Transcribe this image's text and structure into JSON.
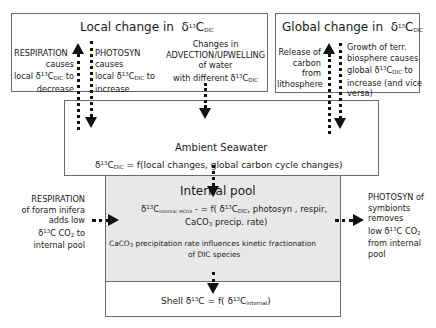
{
  "local_box": {
    "title": "Local change in",
    "title_sym": "δ",
    "title_sup": "13",
    "title_c": "C",
    "title_sub": "DIC",
    "respiration": {
      "line1": "RESPIRATION",
      "line2": "causes",
      "line3_pre": "local δ",
      "line3_sup": "13",
      "line3_c": "C",
      "line3_sub": "DIC",
      "line3_post": " to",
      "line4": "decrease"
    },
    "photosyn": {
      "line1": "PHOTOSYN",
      "line2": "causes",
      "line3_pre": "local δ",
      "line3_sup": "13",
      "line3_c": "C",
      "line3_sub": "DIC",
      "line3_post": " to",
      "line4": "increase"
    },
    "advection": {
      "line1": "Changes in",
      "line2": "ADVECTION/UPWELLING",
      "line3": "of water",
      "line4_pre": "with different  δ",
      "line4_sup": "13",
      "line4_c": "C",
      "line4_sub": "DIC"
    }
  },
  "global_box": {
    "title": "Global change in",
    "title_sym": "δ",
    "title_sup": "13",
    "title_c": "C",
    "title_sub": "DIC",
    "release": {
      "line1": "Release of",
      "line2": "carbon",
      "line3": "from",
      "line4": "lithosphere"
    },
    "growth": {
      "line1": "Growth  of terr.",
      "line2": "biosphere causes",
      "line3_pre": "global δ",
      "line3_sup": "13",
      "line3_c": "C",
      "line3_sub": "DIC",
      "line3_post": " to",
      "line4": "increase (and vice",
      "line5": "versa)"
    }
  },
  "ambient_box": {
    "title": "Ambient Seawater",
    "eq_pre": "δ",
    "eq_sup": "13",
    "eq_c": "C",
    "eq_sub": "DIC",
    "eq_post": " = f(local  changes, global carbon cycle changes)"
  },
  "internal_box": {
    "title": "Internal pool",
    "eq1_pre": "δ",
    "eq1_sup": "13",
    "eq1_c": "C",
    "eq1_sub": "internal, HCO3",
    "eq1_mid": " - = f( δ",
    "eq1_sup2": "13",
    "eq1_c2": "C",
    "eq1_sub2": "DIC",
    "eq1_post": ", photosyn , respir,",
    "eq2_pre": "CaCO",
    "eq2_sub": "3",
    "eq2_post": " precip. rate)",
    "note1_pre": "CaCO",
    "note1_sub": "3",
    "note1_post": " precipitation  rate influences kinetic fractionation",
    "note2": "of DIC species",
    "fill": "#e8e8e8"
  },
  "shell_box": {
    "pre": "Shell δ",
    "sup": "13",
    "mid": "C = f( δ",
    "sup2": "13",
    "c2": "C",
    "sub2": "internal",
    "post": ")"
  },
  "left_note": {
    "line1": "RESPIRATION",
    "line2": "of foram inifera",
    "line3": "adds low",
    "line4_pre": "δ",
    "line4_sup": "13",
    "line4_post": "C CO",
    "line4_sub": "2",
    "line4_end": "  to",
    "line5": "internal  pool"
  },
  "right_note": {
    "line1": "PHOTOSYN  of",
    "line2": "symbionts",
    "line3": "removes",
    "line4_pre": "low  δ",
    "line4_sup": "13",
    "line4_post": "C CO",
    "line4_sub": "2",
    "line5": "from  internal",
    "line6": "pool"
  }
}
